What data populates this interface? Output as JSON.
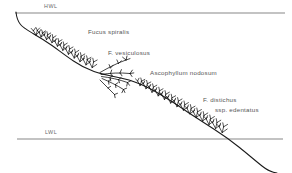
{
  "figure": {
    "background_color": "#ffffff",
    "ink_color": "#1a1a1a",
    "datum_line_color": "#808080",
    "text_color": "#4f4f4f"
  },
  "datum_lines": [
    {
      "id": "hwl",
      "label": "HWL",
      "meaning": "High Water Level",
      "y": 13,
      "x_start": 15,
      "x_end": 285
    },
    {
      "id": "lwl",
      "label": "LWL",
      "meaning": "Low Water Level",
      "y": 139,
      "x_start": 17,
      "x_end": 283
    }
  ],
  "species_labels": [
    {
      "id": "sp1",
      "name": "Fucus spiralis",
      "zone": "upper shore"
    },
    {
      "id": "sp2",
      "name": "F. vesiculosus",
      "zone": "upper-mid shore"
    },
    {
      "id": "sp3",
      "name": "Ascophyllum nodosum",
      "zone": "mid shore"
    },
    {
      "id": "sp4",
      "name": "F. distichus",
      "zone": "lower shore"
    },
    {
      "id": "sp5",
      "name": "ssp. edentatus",
      "zone": "lower shore"
    }
  ],
  "shore_profile": {
    "description": "Rock shore profile sloping from upper left to lower right, crossing the low water level near the right edge",
    "path": "M 16,13 C 17,18 19,22 22,25 C 26,29 32,32 38,36 C 45,41 52,46 60,52 C 68,58 76,64 85,69 C 93,73 101,76 110,78 C 118,80 126,82 134,85 C 143,89 152,94 161,99 C 170,104 179,109 188,114 C 197,119 206,124 215,129 C 224,134 233,140 242,147 C 250,153 259,160 268,167 C 272,170 276,172 280,173"
  }
}
